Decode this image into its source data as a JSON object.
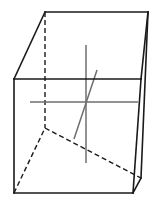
{
  "figure": {
    "type": "line-drawing",
    "width": 158,
    "height": 208,
    "background_color": "#ffffff",
    "projection": "oblique-parallel"
  },
  "style": {
    "edge_color": "#1a1a1a",
    "edge_width": 1.6,
    "hidden_edge_color": "#1a1a1a",
    "hidden_edge_width": 1.4,
    "hidden_dash_pattern": "5,3",
    "axis_color": "#6e6e6e",
    "axis_width": 1.5
  },
  "vertices": {
    "front_top_left": {
      "x": 14,
      "y": 79
    },
    "front_top_right": {
      "x": 141,
      "y": 79
    },
    "front_bottom_left": {
      "x": 14,
      "y": 193
    },
    "front_bottom_right": {
      "x": 133,
      "y": 193
    },
    "back_top_left": {
      "x": 45,
      "y": 12
    },
    "back_top_right": {
      "x": 148,
      "y": 12
    },
    "back_bottom_left": {
      "x": 45,
      "y": 128
    },
    "back_bottom_right": {
      "x": 141,
      "y": 178
    }
  },
  "visible_edges": [
    {
      "name": "front-face-top",
      "from": "front_top_left",
      "to": "front_top_right"
    },
    {
      "name": "front-face-left",
      "from": "front_top_left",
      "to": "front_bottom_left"
    },
    {
      "name": "front-face-bottom",
      "from": "front_bottom_left",
      "to": "front_bottom_right"
    },
    {
      "name": "front-face-right",
      "from": "front_top_right",
      "to": "front_bottom_right"
    },
    {
      "name": "back-face-top",
      "from": "back_top_left",
      "to": "back_top_right"
    },
    {
      "name": "back-face-right",
      "from": "back_top_right",
      "to": "back_bottom_right"
    },
    {
      "name": "top-left-depth",
      "from": "front_top_left",
      "to": "back_top_left"
    },
    {
      "name": "top-right-depth",
      "from": "front_top_right",
      "to": "back_top_right"
    },
    {
      "name": "bottom-right-depth",
      "from": "front_bottom_right",
      "to": "back_bottom_right"
    }
  ],
  "hidden_edges": [
    {
      "name": "back-face-left",
      "from": "back_top_left",
      "to": "back_bottom_left"
    },
    {
      "name": "back-face-bottom",
      "from": "back_bottom_left",
      "to": "back_bottom_right"
    },
    {
      "name": "bottom-left-depth",
      "from": "front_bottom_left",
      "to": "back_bottom_left"
    }
  ],
  "axes": [
    {
      "name": "horizontal-axis",
      "orientation": "horizontal",
      "from": {
        "x": 30,
        "y": 102
      },
      "to": {
        "x": 138,
        "y": 102
      }
    },
    {
      "name": "vertical-axis",
      "orientation": "vertical",
      "from": {
        "x": 86,
        "y": 45
      },
      "to": {
        "x": 86,
        "y": 163
      }
    },
    {
      "name": "depth-axis",
      "orientation": "diagonal",
      "from": {
        "x": 74,
        "y": 139
      },
      "to": {
        "x": 97,
        "y": 70
      }
    }
  ],
  "center_point": {
    "x": 86,
    "y": 102
  }
}
